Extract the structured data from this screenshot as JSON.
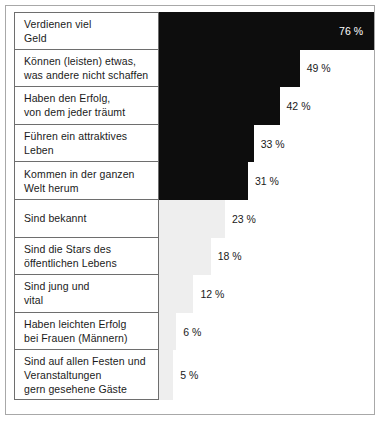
{
  "chart_data": {
    "type": "bar",
    "title": "",
    "subtitle": "",
    "xlabel": "",
    "ylabel": "",
    "orientation": "horizontal",
    "value_suffix": "%",
    "xlim": [
      0,
      76
    ],
    "grid": false,
    "legend": null,
    "categories": [
      "Verdienen viel\nGeld",
      "Können (leisten) etwas,\nwas andere nicht schaffen",
      "Haben den Erfolg,\nvon dem jeder träumt",
      "Führen ein attraktives\nLeben",
      "Kommen in der ganzen\nWelt herum",
      "Sind bekannt",
      "Sind die Stars des\nöffentlichen Lebens",
      "Sind jung und\nvital",
      "Haben leichten Erfolg\nbei Frauen (Männern)",
      "Sind auf allen Festen und\nVeranstaltungen\ngern gesehene Gäste"
    ],
    "values": [
      76,
      49,
      42,
      33,
      31,
      23,
      18,
      12,
      6,
      5
    ],
    "value_labels": [
      "76 %",
      "49 %",
      "42 %",
      "33 %",
      "31 %",
      "23 %",
      "18 %",
      "12 %",
      "6 %",
      "5 %"
    ],
    "bar_colors": [
      "#0d0d0d",
      "#0d0d0d",
      "#0d0d0d",
      "#0d0d0d",
      "#0d0d0d",
      "#eeeeee",
      "#eeeeee",
      "#eeeeee",
      "#eeeeee",
      "#eeeeee"
    ],
    "label_inside": [
      true,
      false,
      false,
      false,
      false,
      false,
      false,
      false,
      false,
      false
    ]
  },
  "colors": {
    "dark_bar": "#0d0d0d",
    "light_bar": "#eeeeee",
    "frame": "#a8a8a8",
    "label_border": "#6e6e6e",
    "text": "#1a1a1a",
    "text_inverted": "#ffffff"
  }
}
